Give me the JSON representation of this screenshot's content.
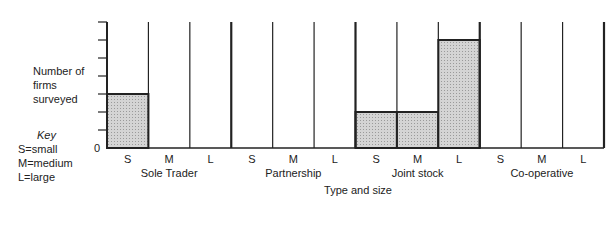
{
  "chart_data": {
    "type": "bar",
    "title": "",
    "ylabel": "Number of firms surveyed",
    "xlabel": "Type and size",
    "ylim": [
      0,
      7
    ],
    "y_tick_count": 7,
    "y_tick_labels": [
      "0"
    ],
    "groups": [
      "Sole Trader",
      "Partnership",
      "Joint stock",
      "Co-operative"
    ],
    "sizes": [
      "S",
      "M",
      "L"
    ],
    "categories": [
      "Sole Trader S",
      "Sole Trader M",
      "Sole Trader L",
      "Partnership S",
      "Partnership M",
      "Partnership L",
      "Joint stock S",
      "Joint stock M",
      "Joint stock L",
      "Co-operative S",
      "Co-operative M",
      "Co-operative L"
    ],
    "values": [
      3,
      0,
      0,
      0,
      0,
      0,
      2,
      2,
      6,
      0,
      0,
      0
    ],
    "key": {
      "title": "Key",
      "entries": [
        "S=small",
        "M=medium",
        "L=large"
      ]
    },
    "grid": false,
    "legend": "left"
  }
}
